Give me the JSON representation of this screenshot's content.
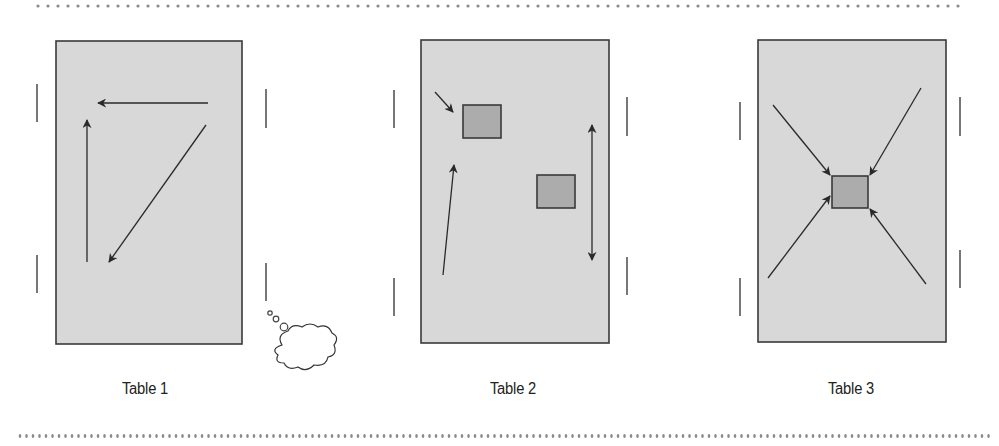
{
  "colors": {
    "table_fill": "#d8d8d8",
    "table_stroke": "#3a3a3a",
    "square_fill": "#acacac",
    "arrow": "#2a2a2a",
    "dots": "#8a8a8a",
    "marks": "#555555"
  },
  "separators": {
    "top": {
      "y": 6,
      "x_start": 38,
      "x_end": 966,
      "spacing": 10
    },
    "bottom": {
      "y": 436,
      "x_start": 20,
      "x_end": 990,
      "spacing": 6.5
    }
  },
  "tables": [
    {
      "label": "Table 1",
      "rect": {
        "x": 56,
        "y": 41,
        "w": 186,
        "h": 303
      },
      "label_center_x": 145,
      "squares": [],
      "arrows": [
        {
          "from": [
            208,
            103
          ],
          "to": [
            98,
            103
          ],
          "double": false
        },
        {
          "from": [
            87,
            262
          ],
          "to": [
            87,
            120
          ],
          "double": false
        },
        {
          "from": [
            206,
            125
          ],
          "to": [
            109,
            262
          ],
          "double": false
        }
      ],
      "side_marks": [
        {
          "x": 37,
          "y1": 84,
          "y2": 122
        },
        {
          "x": 37,
          "y1": 255,
          "y2": 293
        },
        {
          "x": 266,
          "y1": 89,
          "y2": 128
        },
        {
          "x": 266,
          "y1": 263,
          "y2": 301
        }
      ],
      "thought_bubble": true
    },
    {
      "label": "Table 2",
      "rect": {
        "x": 421,
        "y": 40,
        "w": 188,
        "h": 303
      },
      "label_center_x": 513,
      "squares": [
        {
          "x": 463,
          "y": 105,
          "w": 38,
          "h": 33
        },
        {
          "x": 537,
          "y": 175,
          "w": 38,
          "h": 33
        }
      ],
      "arrows": [
        {
          "from": [
            435,
            92
          ],
          "to": [
            453,
            112
          ],
          "double": false
        },
        {
          "from": [
            443,
            275
          ],
          "to": [
            454,
            165
          ],
          "double": false
        },
        {
          "from": [
            592,
            260
          ],
          "to": [
            592,
            125
          ],
          "double": true
        }
      ],
      "side_marks": [
        {
          "x": 394,
          "y1": 90,
          "y2": 128
        },
        {
          "x": 394,
          "y1": 278,
          "y2": 316
        },
        {
          "x": 627,
          "y1": 97,
          "y2": 136
        },
        {
          "x": 627,
          "y1": 257,
          "y2": 295
        }
      ],
      "thought_bubble": false
    },
    {
      "label": "Table 3",
      "rect": {
        "x": 758,
        "y": 40,
        "w": 188,
        "h": 302
      },
      "label_center_x": 851,
      "squares": [
        {
          "x": 832,
          "y": 176,
          "w": 36,
          "h": 32
        }
      ],
      "arrows": [
        {
          "from": [
            773,
            105
          ],
          "to": [
            830,
            175
          ],
          "double": false
        },
        {
          "from": [
            921,
            88
          ],
          "to": [
            870,
            175
          ],
          "double": false
        },
        {
          "from": [
            768,
            278
          ],
          "to": [
            830,
            196
          ],
          "double": false
        },
        {
          "from": [
            926,
            284
          ],
          "to": [
            870,
            209
          ],
          "double": false
        }
      ],
      "side_marks": [
        {
          "x": 740,
          "y1": 102,
          "y2": 140
        },
        {
          "x": 740,
          "y1": 278,
          "y2": 316
        },
        {
          "x": 960,
          "y1": 97,
          "y2": 136
        },
        {
          "x": 960,
          "y1": 250,
          "y2": 288
        }
      ],
      "thought_bubble": false
    }
  ]
}
